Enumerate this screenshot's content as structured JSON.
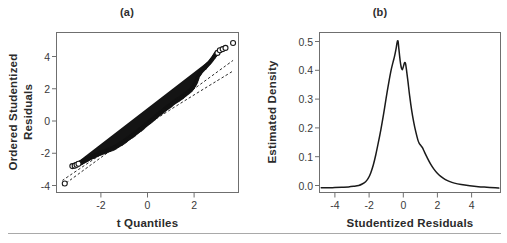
{
  "figure": {
    "background_color": "#ffffff",
    "ink_color": "#1a1a1a",
    "frame_color": "#6f6f6f",
    "rule_color": "#a9a9a9",
    "panels": [
      {
        "key": "a",
        "label": "(a)"
      },
      {
        "key": "b",
        "label": "(b)"
      }
    ]
  },
  "chart_data": [
    {
      "type": "scatter",
      "panel": "(a)",
      "title": "(a)",
      "xlabel": "t Quantiles",
      "ylabel": "Ordered Studentized Residuals",
      "ylabel_lines": [
        "Ordered Studentized",
        "Residuals"
      ],
      "xlim": [
        -3.85,
        3.85
      ],
      "ylim": [
        -4.7,
        5.9
      ],
      "xticks": [
        -2,
        0,
        2
      ],
      "xticklabels": [
        "-2",
        "0",
        "2"
      ],
      "yticks": [
        -4,
        -2,
        0,
        2,
        4
      ],
      "yticklabels": [
        "-4",
        "-2",
        "0",
        "2",
        "4"
      ],
      "grid": false,
      "legend": "none",
      "marker": "open-circle",
      "notes": "QQ plot of ordered studentized residuals against t quantiles; dense overplotted band of points with a few separated open circles in the tails; two dashed reference/confidence lines.",
      "points": [
        {
          "x": -3.5,
          "y": -4.1
        },
        {
          "x": -3.18,
          "y": -2.95
        },
        {
          "x": -3.08,
          "y": -2.92
        },
        {
          "x": -3.0,
          "y": -2.86
        },
        {
          "x": -2.92,
          "y": -2.8
        },
        {
          "x": -2.84,
          "y": -2.74
        },
        {
          "x": -2.74,
          "y": -2.66
        },
        {
          "x": -2.62,
          "y": -2.56
        },
        {
          "x": -2.48,
          "y": -2.44
        },
        {
          "x": -2.3,
          "y": -2.3
        },
        {
          "x": -2.1,
          "y": -2.16
        },
        {
          "x": -1.9,
          "y": -2.04
        },
        {
          "x": -1.7,
          "y": -1.92
        },
        {
          "x": -1.5,
          "y": -1.8
        },
        {
          "x": -1.3,
          "y": -1.64
        },
        {
          "x": -1.1,
          "y": -1.44
        },
        {
          "x": -0.9,
          "y": -1.22
        },
        {
          "x": -0.7,
          "y": -1.0
        },
        {
          "x": -0.5,
          "y": -0.76
        },
        {
          "x": -0.3,
          "y": -0.52
        },
        {
          "x": -0.1,
          "y": -0.26
        },
        {
          "x": 0.1,
          "y": 0.0
        },
        {
          "x": 0.3,
          "y": 0.26
        },
        {
          "x": 0.5,
          "y": 0.52
        },
        {
          "x": 0.7,
          "y": 0.76
        },
        {
          "x": 0.9,
          "y": 1.0
        },
        {
          "x": 1.1,
          "y": 1.24
        },
        {
          "x": 1.3,
          "y": 1.46
        },
        {
          "x": 1.5,
          "y": 1.68
        },
        {
          "x": 1.7,
          "y": 1.92
        },
        {
          "x": 1.9,
          "y": 2.2
        },
        {
          "x": 2.05,
          "y": 2.6
        },
        {
          "x": 2.15,
          "y": 3.05
        },
        {
          "x": 2.28,
          "y": 3.35
        },
        {
          "x": 2.45,
          "y": 3.62
        },
        {
          "x": 2.62,
          "y": 3.9
        },
        {
          "x": 2.78,
          "y": 4.22
        },
        {
          "x": 2.88,
          "y": 4.45
        },
        {
          "x": 2.96,
          "y": 4.55
        },
        {
          "x": 3.06,
          "y": 4.72
        },
        {
          "x": 3.18,
          "y": 4.8
        },
        {
          "x": 3.3,
          "y": 4.88
        },
        {
          "x": 3.62,
          "y": 5.2
        }
      ],
      "reference_lines": [
        {
          "name": "upper-dashed-reference",
          "style": "dashed",
          "points": [
            {
              "x": -3.6,
              "y": -3.9
            },
            {
              "x": 0.0,
              "y": -0.05
            },
            {
              "x": 3.62,
              "y": 4.05
            }
          ]
        },
        {
          "name": "lower-dashed-reference",
          "style": "dashed",
          "points": [
            {
              "x": -3.6,
              "y": -4.25
            },
            {
              "x": 0.0,
              "y": -0.2
            },
            {
              "x": 3.62,
              "y": 3.35
            }
          ]
        }
      ]
    },
    {
      "type": "line",
      "panel": "(b)",
      "title": "(b)",
      "xlabel": "Studentized Residuals",
      "ylabel": "Estimated Density",
      "xlim": [
        -4.9,
        5.7
      ],
      "ylim": [
        -0.012,
        0.535
      ],
      "xticks": [
        -4,
        -2,
        0,
        2,
        4
      ],
      "xticklabels": [
        "-4",
        "-2",
        "0",
        "2",
        "4"
      ],
      "yticks": [
        0.0,
        0.1,
        0.2,
        0.3,
        0.4,
        0.5
      ],
      "yticklabels": [
        "0.0",
        "0.1",
        "0.2",
        "0.3",
        "0.4",
        "0.5"
      ],
      "grid": false,
      "legend": "none",
      "notes": "Kernel density estimate of studentized residuals: sharp primary mode near -0.35 at about 0.505, a small secondary bump near 0.1 at about 0.43, a shoulder near 1.0 at about 0.15, and long flat tails.",
      "x": [
        -4.8,
        -4.4,
        -4.0,
        -3.6,
        -3.2,
        -2.9,
        -2.6,
        -2.4,
        -2.2,
        -2.05,
        -1.9,
        -1.75,
        -1.6,
        -1.45,
        -1.3,
        -1.15,
        -1.0,
        -0.9,
        -0.8,
        -0.7,
        -0.6,
        -0.5,
        -0.42,
        -0.35,
        -0.3,
        -0.25,
        -0.18,
        -0.12,
        -0.05,
        0.02,
        0.08,
        0.14,
        0.2,
        0.28,
        0.38,
        0.5,
        0.62,
        0.74,
        0.86,
        0.95,
        1.02,
        1.12,
        1.25,
        1.4,
        1.6,
        1.8,
        2.0,
        2.2,
        2.45,
        2.7,
        3.0,
        3.4,
        3.9,
        4.4,
        4.9,
        5.4,
        5.6
      ],
      "y": [
        0.004,
        0.004,
        0.005,
        0.006,
        0.007,
        0.009,
        0.012,
        0.017,
        0.025,
        0.036,
        0.055,
        0.082,
        0.118,
        0.16,
        0.205,
        0.255,
        0.31,
        0.345,
        0.378,
        0.408,
        0.432,
        0.455,
        0.478,
        0.502,
        0.505,
        0.478,
        0.44,
        0.418,
        0.408,
        0.42,
        0.432,
        0.428,
        0.405,
        0.368,
        0.318,
        0.268,
        0.228,
        0.195,
        0.168,
        0.155,
        0.15,
        0.142,
        0.126,
        0.108,
        0.086,
        0.068,
        0.054,
        0.043,
        0.033,
        0.026,
        0.02,
        0.015,
        0.011,
        0.008,
        0.006,
        0.004,
        0.003
      ]
    }
  ]
}
